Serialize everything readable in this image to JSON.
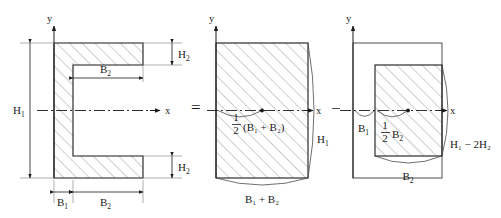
{
  "figure": {
    "operators": {
      "equals": "=",
      "minus": "−"
    }
  },
  "panels": [
    {
      "id": "channel-section",
      "name": "channel-section",
      "axis": {
        "x_label": "x",
        "y_label": "y"
      },
      "dimensions": [
        {
          "name": "overall-height",
          "label": "H",
          "sub": "1"
        },
        {
          "name": "top-flange-thickness",
          "label": "H",
          "sub": "2"
        },
        {
          "name": "bottom-flange-thickness",
          "label": "H",
          "sub": "2"
        },
        {
          "name": "inner-flange-width",
          "label": "B",
          "sub": "2"
        },
        {
          "name": "web-thickness",
          "label": "B",
          "sub": "1"
        },
        {
          "name": "flange-width",
          "label": "B",
          "sub": "2"
        }
      ]
    },
    {
      "id": "full-rectangle",
      "name": "full-rectangle",
      "axis": {
        "x_label": "x",
        "y_label": "y"
      },
      "dimensions": [
        {
          "name": "full-rect-height",
          "label": "H",
          "sub": "1"
        },
        {
          "name": "full-rect-width",
          "label": "B₁ + B₂"
        }
      ],
      "centroid": {
        "name": "centroid-distance",
        "fraction_num": "1",
        "fraction_den": "2",
        "expression": "(B₁ + B₂)"
      }
    },
    {
      "id": "subtracted-rectangle",
      "name": "subtracted-rectangle",
      "axis": {
        "x_label": "x",
        "y_label": "y"
      },
      "dimensions": [
        {
          "name": "inner-rect-height",
          "label": "H₁ − 2H₂"
        },
        {
          "name": "inner-rect-width",
          "label": "B",
          "sub": "2"
        },
        {
          "name": "offset-width",
          "label": "B",
          "sub": "1"
        }
      ],
      "centroid": {
        "name": "inner-centroid-distance",
        "fraction_num": "1",
        "fraction_den": "2",
        "expression": "B",
        "expression_sub": "2"
      }
    }
  ],
  "labels": {
    "y_axis": "y",
    "x_axis": "x",
    "H": "H",
    "B": "B",
    "sub1": "1",
    "sub2": "2",
    "H1_minus_2H2": "H₁ − 2H₂",
    "B1_plus_B2": "B₁ + B₂",
    "half_B1_plus_B2": "(B₁ + B₂)",
    "half": "1",
    "half_den": "2"
  },
  "colors": {
    "stroke": "#1a1a1a",
    "hatch": "#8d8d8d",
    "dimension": "#1a1a1a",
    "extension": "#7a7a7a",
    "background": "#ffffff"
  }
}
